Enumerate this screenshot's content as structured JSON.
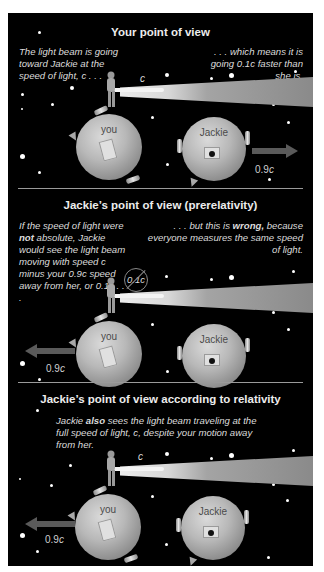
{
  "panels": [
    {
      "title": "Your point of view",
      "caption_left": "The light beam is going toward Jackie at the speed of light, c . . .",
      "caption_right": ". . . which means it is going 0.1c faster than she is.",
      "beam_label": "c",
      "you_label": "you",
      "jackie_label": "Jackie",
      "motion": {
        "label_num": "0.9",
        "label_c": "c",
        "direction": "right",
        "who": "Jackie"
      }
    },
    {
      "title": "Jackie’s point of view (prerelativity)",
      "caption_left_pre": "If the speed of light were ",
      "caption_left_bold": "not",
      "caption_left_post": " absolute, Jackie would see the light beam moving with speed c minus your 0.9c speed away from her, or 0.1c . . .",
      "caption_right_pre": ". . . but this is ",
      "caption_right_bold": "wrong,",
      "caption_right_post": " because everyone measures the same speed of light.",
      "beam_label_crossed": "0.1c",
      "you_label": "you",
      "jackie_label": "Jackie",
      "motion": {
        "label_num": "0.9",
        "label_c": "c",
        "direction": "left",
        "who": "you"
      }
    },
    {
      "title": "Jackie’s point of view according to relativity",
      "caption_pre": "Jackie ",
      "caption_bold": "also",
      "caption_post": " sees the light beam traveling at the full speed of light, c, despite your motion away from her.",
      "beam_label": "c",
      "you_label": "you",
      "jackie_label": "Jackie",
      "motion": {
        "label_num": "0.9",
        "label_c": "c",
        "direction": "left",
        "who": "you"
      }
    }
  ],
  "colors": {
    "background": "#000000",
    "text": "#dcdcdc",
    "divider": "#9a9a9a",
    "arrow": "#555555"
  }
}
